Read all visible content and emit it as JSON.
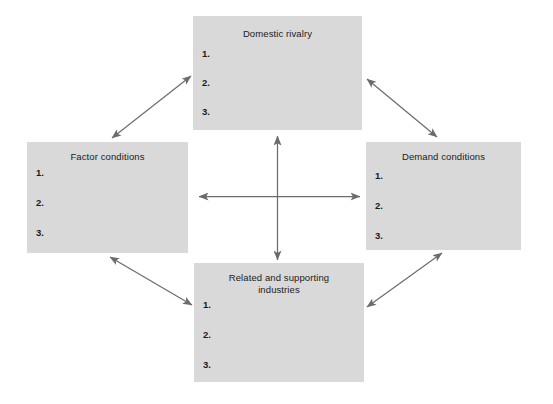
{
  "diagram": {
    "type": "porter-diamond",
    "background_color": "#ffffff",
    "box_fill_color": "#d9d9d9",
    "arrow_color": "#6b6b6b",
    "text_color": "#1b1b1b",
    "nodes": {
      "top": {
        "title": "Domestic rivalry",
        "items": [
          "1.",
          "2.",
          "3."
        ]
      },
      "left": {
        "title": "Factor conditions",
        "items": [
          "1.",
          "2.",
          "3."
        ]
      },
      "right": {
        "title": "Demand conditions",
        "items": [
          "1.",
          "2.",
          "3."
        ]
      },
      "bottom": {
        "title": "Related and supporting industries",
        "title_line1": "Related and supporting",
        "title_line2": "industries",
        "items": [
          "1.",
          "2.",
          "3."
        ]
      }
    },
    "connectors": [
      {
        "name": "vertical-double-arrow",
        "from": "center-bottom",
        "to": "center-top",
        "double_headed": true
      },
      {
        "name": "horizontal-double-arrow",
        "from": "center-left",
        "to": "center-right",
        "double_headed": true
      },
      {
        "name": "diagonal-top-left",
        "from": "factor-conditions",
        "to": "domestic-rivalry",
        "double_headed": true
      },
      {
        "name": "diagonal-top-right",
        "from": "domestic-rivalry",
        "to": "demand-conditions",
        "double_headed": true
      },
      {
        "name": "diagonal-bottom-left",
        "from": "factor-conditions",
        "to": "related-industries",
        "double_headed": true
      },
      {
        "name": "diagonal-bottom-right",
        "from": "related-industries",
        "to": "demand-conditions",
        "double_headed": true
      }
    ]
  }
}
